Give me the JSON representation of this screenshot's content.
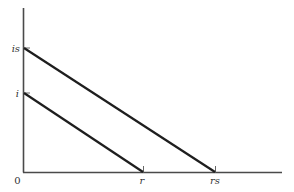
{
  "diagram": {
    "origin_label": "0",
    "y_axis": {
      "ticks": [
        {
          "label": "is",
          "y": 48
        },
        {
          "label": "i",
          "y": 93
        }
      ]
    },
    "x_axis": {
      "ticks": [
        {
          "label": "r",
          "x": 143
        },
        {
          "label": "rs",
          "x": 215
        }
      ]
    },
    "lines": [
      {
        "name": "line-i-to-r",
        "from_label": "i",
        "to_label": "r"
      },
      {
        "name": "line-is-to-rs",
        "from_label": "is",
        "to_label": "rs"
      }
    ],
    "colors": {
      "axis": "#4a4a4a",
      "line": "#1e1e1e",
      "text": "#333333"
    }
  }
}
